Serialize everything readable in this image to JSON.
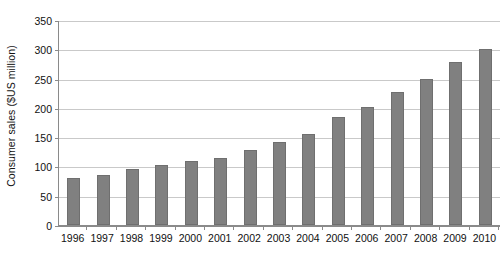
{
  "chart_data": {
    "type": "bar",
    "title": "",
    "xlabel": "",
    "ylabel": "Consumer sales ($US million)",
    "categories": [
      "1996",
      "1997",
      "1998",
      "1999",
      "2000",
      "2001",
      "2002",
      "2003",
      "2004",
      "2005",
      "2006",
      "2007",
      "2008",
      "2009",
      "2010"
    ],
    "values": [
      80,
      85,
      95,
      103,
      109,
      115,
      128,
      142,
      156,
      184,
      202,
      227,
      250,
      278,
      300
    ],
    "ylim": [
      0,
      350
    ],
    "ytick_step": 50,
    "yticks": [
      0,
      50,
      100,
      150,
      200,
      250,
      300,
      350
    ],
    "ytick_labels": [
      "0",
      "50",
      "100",
      "150",
      "200",
      "250",
      "300",
      "350"
    ],
    "grid": true,
    "grid_axis": "y",
    "legend": false,
    "legend_position": "none",
    "series": [
      {
        "name": "Consumer sales",
        "color": "#808080",
        "values": [
          80,
          85,
          95,
          103,
          109,
          115,
          128,
          142,
          156,
          184,
          202,
          227,
          250,
          278,
          300
        ]
      }
    ]
  },
  "style": {
    "bar_color": "#808080",
    "bar_edge_color": "#6F6F6F",
    "gridline_color": "#C9C9C9",
    "axis_color": "#8A8A8A",
    "text_color": "#111111",
    "background": "#FFFFFF"
  }
}
